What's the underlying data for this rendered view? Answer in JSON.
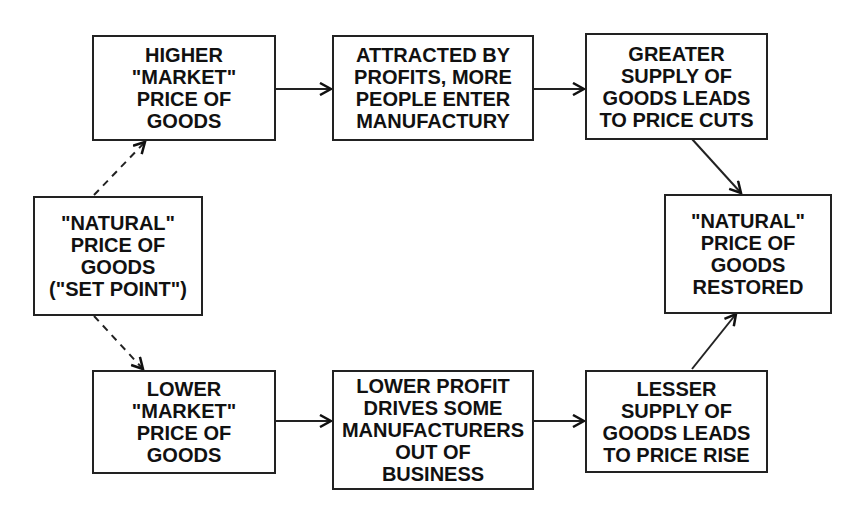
{
  "nodes": {
    "natural_start": {
      "lines": [
        "\"NATURAL\"",
        "PRICE OF",
        "GOODS",
        "(\"SET POINT\")"
      ]
    },
    "higher_market": {
      "lines": [
        "HIGHER",
        "\"MARKET\"",
        "PRICE OF",
        "GOODS"
      ]
    },
    "attracted": {
      "lines": [
        "ATTRACTED BY",
        "PROFITS, MORE",
        "PEOPLE ENTER",
        "MANUFACTURY"
      ]
    },
    "greater_supply": {
      "lines": [
        "GREATER",
        "SUPPLY OF",
        "GOODS LEADS",
        "TO PRICE CUTS"
      ]
    },
    "natural_restored": {
      "lines": [
        "\"NATURAL\"",
        "PRICE OF",
        "GOODS",
        "RESTORED"
      ]
    },
    "lower_market": {
      "lines": [
        "LOWER",
        "\"MARKET\"",
        "PRICE OF",
        "GOODS"
      ]
    },
    "lower_profit": {
      "lines": [
        "LOWER PROFIT",
        "DRIVES SOME",
        "MANUFACTURERS",
        "OUT OF",
        "BUSINESS"
      ]
    },
    "lesser_supply": {
      "lines": [
        "LESSER",
        "SUPPLY OF",
        "GOODS LEADS",
        "TO PRICE RISE"
      ]
    }
  },
  "edges": [
    {
      "from": "natural_start",
      "to": "higher_market",
      "style": "dashed"
    },
    {
      "from": "natural_start",
      "to": "lower_market",
      "style": "dashed"
    },
    {
      "from": "higher_market",
      "to": "attracted",
      "style": "solid"
    },
    {
      "from": "attracted",
      "to": "greater_supply",
      "style": "solid"
    },
    {
      "from": "greater_supply",
      "to": "natural_restored",
      "style": "solid"
    },
    {
      "from": "lower_market",
      "to": "lower_profit",
      "style": "solid"
    },
    {
      "from": "lower_profit",
      "to": "lesser_supply",
      "style": "solid"
    },
    {
      "from": "lesser_supply",
      "to": "natural_restored",
      "style": "solid"
    }
  ]
}
